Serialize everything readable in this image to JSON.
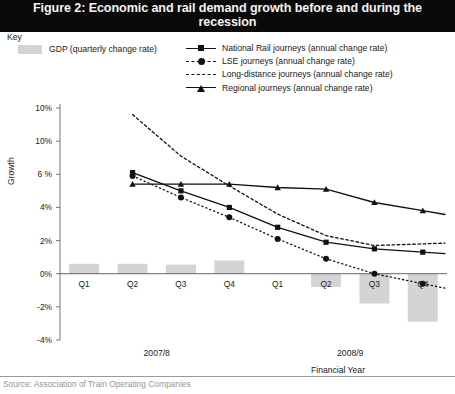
{
  "title": "Figure 2: Economic and rail demand growth before and during the recession",
  "key": {
    "heading": "Key",
    "gdp_label": "GDP (quarterly change rate)",
    "gdp_color": "#d4d4d4"
  },
  "legend": {
    "position": "top",
    "items": [
      {
        "label": "National Rail journeys (annual change rate)",
        "glyph": "solid-line-square-marker",
        "color": "#111111"
      },
      {
        "label": "LSE journeys (annual change rate)",
        "glyph": "dashed-line-circle-marker",
        "color": "#111111"
      },
      {
        "label": "Long-distance journeys (annual change rate)",
        "glyph": "dotted-line",
        "color": "#111111"
      },
      {
        "label": "Regional journeys (annual change rate)",
        "glyph": "solid-line-triangle-marker",
        "color": "#111111"
      }
    ]
  },
  "source": "Source: Association of Train Operating Companies",
  "chart_data": {
    "type": "bar",
    "title": "Figure 2: Economic and rail demand growth before and during the recession",
    "subtitle": "",
    "xlabel": "Financial Year",
    "ylabel": "Growth",
    "ylim": [
      -4,
      10
    ],
    "grid": false,
    "y_ticks": [
      10,
      10,
      6,
      4,
      2,
      0,
      -2,
      -4
    ],
    "y_tick_labels": [
      "10%",
      "10%",
      "6 %",
      "4%",
      "2%",
      "0%",
      "-2%",
      "-4%"
    ],
    "categories": [
      "Q1",
      "Q2",
      "Q3",
      "Q4",
      "Q1",
      "Q2",
      "Q3",
      "Q4"
    ],
    "year_groups": [
      {
        "label": "2007/8",
        "quarters": [
          "Q1",
          "Q2",
          "Q3",
          "Q4"
        ]
      },
      {
        "label": "2008/9",
        "quarters": [
          "Q1",
          "Q2",
          "Q3",
          "Q4"
        ]
      }
    ],
    "bars": {
      "name": "GDP (quarterly change rate)",
      "color": "#d4d4d4",
      "values": [
        0.6,
        0.6,
        0.55,
        0.8,
        0.0,
        -0.8,
        -1.8,
        -2.9
      ]
    },
    "series": [
      {
        "name": "National Rail journeys (annual change rate)",
        "style": "solid",
        "marker": "square",
        "x": [
          "Q2",
          "Q3",
          "Q4",
          "Q1",
          "Q2",
          "Q3",
          "Q4"
        ],
        "values": [
          6.1,
          5.0,
          4.0,
          2.8,
          1.9,
          1.5,
          1.3
        ]
      },
      {
        "name": "LSE journeys (annual change rate)",
        "style": "dashed",
        "marker": "circle",
        "x": [
          "Q2",
          "Q3",
          "Q4",
          "Q1",
          "Q2",
          "Q3",
          "Q4"
        ],
        "values": [
          5.9,
          4.6,
          3.4,
          2.1,
          0.9,
          0.0,
          -0.6
        ]
      },
      {
        "name": "Long-distance journeys (annual change rate)",
        "style": "dotted",
        "marker": "none",
        "x": [
          "Q2",
          "Q3",
          "Q4",
          "Q1",
          "Q2",
          "Q3",
          "Q4"
        ],
        "values": [
          9.6,
          7.1,
          5.3,
          3.6,
          2.3,
          1.7,
          1.8
        ]
      },
      {
        "name": "Regional journeys (annual change rate)",
        "style": "solid",
        "marker": "triangle",
        "x": [
          "Q2",
          "Q3",
          "Q4",
          "Q1",
          "Q2",
          "Q3",
          "Q4"
        ],
        "values": [
          5.4,
          5.4,
          5.4,
          5.2,
          5.1,
          4.3,
          3.8
        ]
      }
    ]
  }
}
